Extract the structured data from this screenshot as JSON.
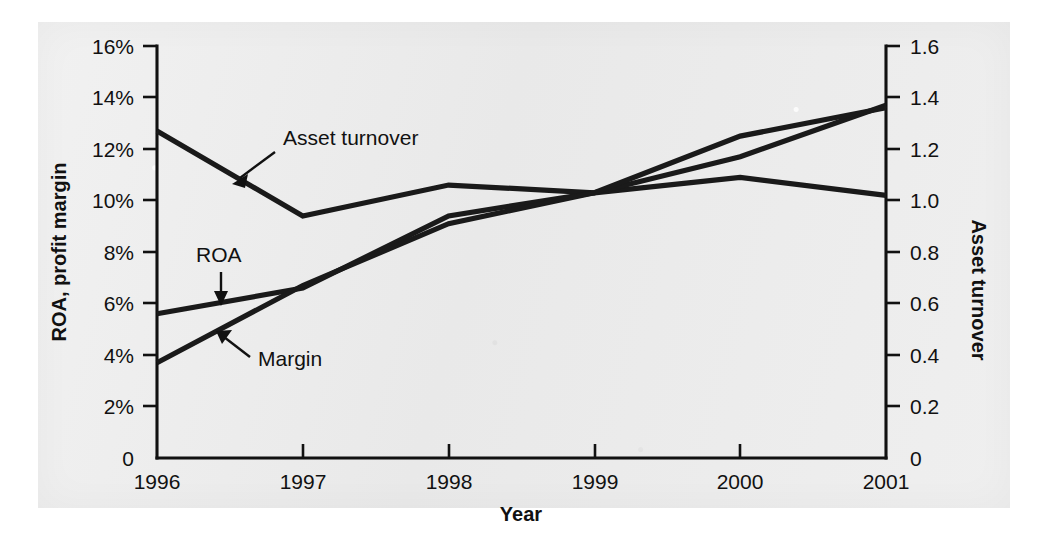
{
  "chart_data": {
    "type": "line",
    "title": "",
    "xlabel": "Year",
    "ylabel": "ROA, profit margin",
    "y2label": "Asset turnover",
    "grid": false,
    "legend": "inline-annotations",
    "x": [
      "1996",
      "1997",
      "1998",
      "1999",
      "2000",
      "2001"
    ],
    "xtick_labels": [
      "1996",
      "1997",
      "1998",
      "1999",
      "2000",
      "2001"
    ],
    "ylim": [
      0,
      16
    ],
    "ytick_labels": [
      "0",
      "2%",
      "4%",
      "6%",
      "8%",
      "10%",
      "12%",
      "14%",
      "16%"
    ],
    "ytick_values": [
      0,
      2,
      4,
      6,
      8,
      10,
      12,
      14,
      16
    ],
    "y2lim": [
      0,
      1.6
    ],
    "y2tick_labels": [
      "0",
      "0.2",
      "0.4",
      "0.6",
      "0.8",
      "1.0",
      "1.2",
      "1.4",
      "1.6"
    ],
    "y2tick_values": [
      0,
      0.2,
      0.4,
      0.6,
      0.8,
      1.0,
      1.2,
      1.4,
      1.6
    ],
    "series": [
      {
        "name": "Asset turnover",
        "axis": "right",
        "unit": "x",
        "values": [
          1.27,
          0.94,
          1.06,
          1.03,
          1.09,
          1.02
        ],
        "label_text": "Asset turnover"
      },
      {
        "name": "ROA",
        "axis": "left",
        "unit": "%",
        "values": [
          5.6,
          6.6,
          9.4,
          10.3,
          11.7,
          13.7
        ],
        "label_text": "ROA"
      },
      {
        "name": "Margin",
        "axis": "left",
        "unit": "%",
        "values": [
          3.7,
          6.7,
          9.1,
          10.3,
          12.5,
          13.6
        ],
        "label_text": "Margin"
      }
    ],
    "annotations": [
      {
        "text": "Asset turnover",
        "target_x": "1996.9",
        "target_y": "11.0"
      },
      {
        "text": "ROA",
        "target_x": "1996.7",
        "target_y": "6.7"
      },
      {
        "text": "Margin",
        "target_x": "1996.5",
        "target_y": "5.1"
      }
    ]
  }
}
